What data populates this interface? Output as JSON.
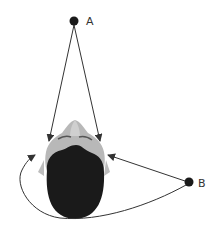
{
  "diagram": {
    "type": "top-down head with sound source points",
    "points": [
      {
        "id": "A",
        "label": "A",
        "x": 74,
        "y": 21
      },
      {
        "id": "B",
        "label": "B",
        "x": 189,
        "y": 182
      }
    ],
    "arrows": [
      {
        "from": "A",
        "to": "left-ear",
        "style": "straight"
      },
      {
        "from": "A",
        "to": "right-ear",
        "style": "straight"
      },
      {
        "from": "B",
        "to": "right-ear",
        "style": "straight"
      },
      {
        "from": "B",
        "to": "left-ear",
        "style": "curved around back of head"
      }
    ],
    "colors": {
      "background": "#ffffff",
      "hair": "#1a1a1a",
      "skin": "#b5b5b5",
      "skin_highlight": "#d0d0d0",
      "line": "#333333",
      "point": "#1a1a1a"
    }
  }
}
